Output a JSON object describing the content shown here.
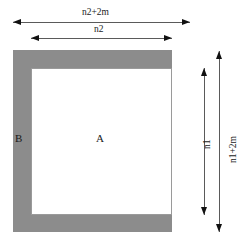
{
  "diagram": {
    "regions": [
      {
        "id": "A",
        "label": "A",
        "description": "inner white rectangle region"
      },
      {
        "id": "B",
        "label": "B",
        "description": "outer gray border band region"
      }
    ],
    "dimensions": {
      "top_outer": "n2+2m",
      "top_inner": "n2",
      "right_inner": "n1",
      "right_outer": "n1+2m"
    },
    "colors": {
      "band_fill": "#8c8c8c",
      "inner_fill": "#ffffff",
      "line": "#5a5a5a",
      "arrow": "#111111",
      "text": "#1a1a1a",
      "background": "#ffffff"
    }
  }
}
